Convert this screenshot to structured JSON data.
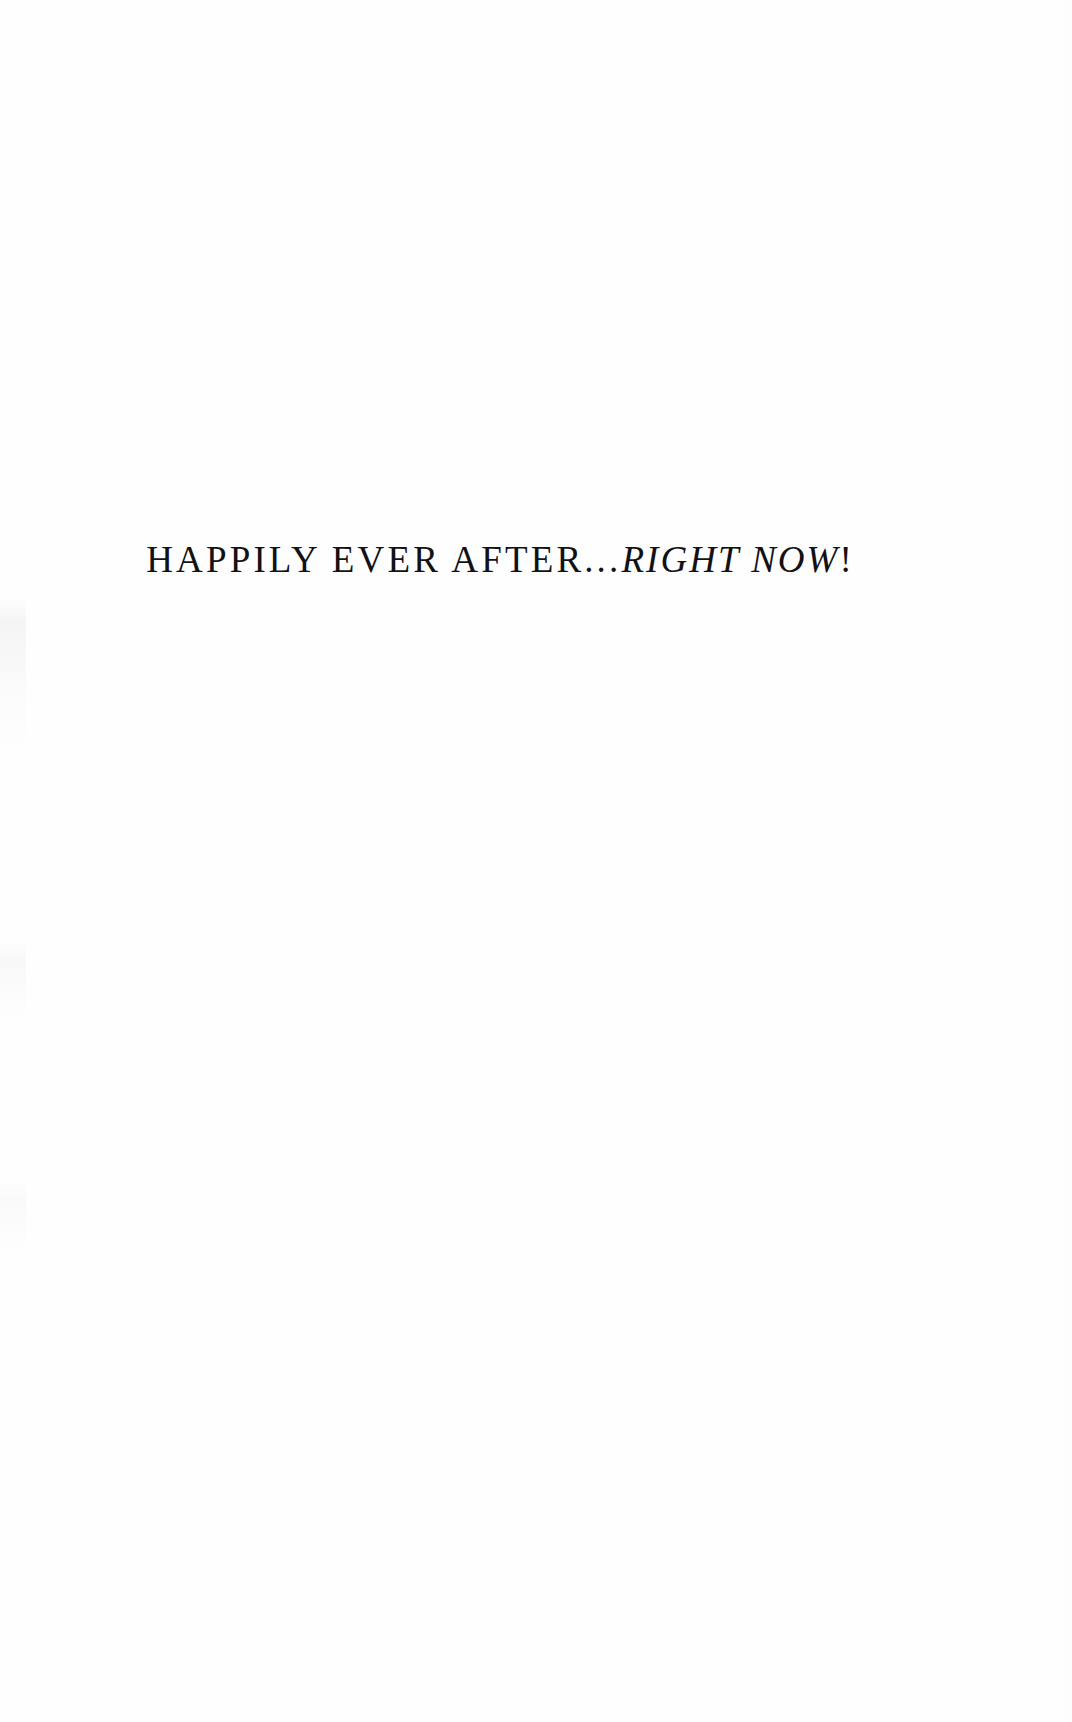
{
  "page": {
    "background_color": "#fefefe",
    "text_color": "#121114",
    "width": 1072,
    "height": 1722
  },
  "title": {
    "full_text": "HAPPILY EVER AFTER...RIGHT NOW!",
    "roman_part": "HAPPILY EVER AFTER...",
    "italic_part": "RIGHT NOW",
    "terminal_punctuation": "!"
  }
}
